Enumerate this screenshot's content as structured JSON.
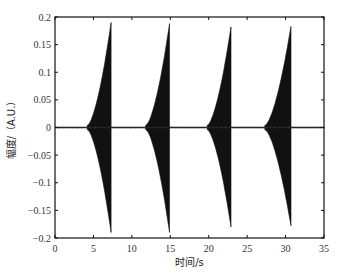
{
  "chart_data": {
    "type": "line",
    "title": "",
    "xlabel": "时间/s",
    "ylabel": "幅度/（A.U.）",
    "xlim": [
      0,
      35
    ],
    "ylim": [
      -0.2,
      0.2
    ],
    "xticks": [
      0,
      5,
      10,
      15,
      20,
      25,
      30,
      35
    ],
    "xtick_labels": [
      "0",
      "5",
      "10",
      "15",
      "20",
      "25",
      "30",
      "35"
    ],
    "yticks": [
      0.2,
      0.15,
      0.1,
      0.05,
      0,
      -0.05,
      -0.1,
      -0.15,
      -0.2
    ],
    "ytick_labels": [
      "0.2",
      "0.15",
      "0.1",
      "0.05",
      "0",
      "−0.05",
      "−0.1",
      "−0.15",
      "−0.2"
    ],
    "grid": false,
    "legend": null,
    "series": [
      {
        "name": "signal",
        "color": "#111111",
        "bursts": [
          {
            "start": 4.2,
            "peak_time": 7.3,
            "peak_pos": 0.19,
            "peak_neg": -0.19
          },
          {
            "start": 11.8,
            "peak_time": 14.9,
            "peak_pos": 0.188,
            "peak_neg": -0.19
          },
          {
            "start": 19.8,
            "peak_time": 22.9,
            "peak_pos": 0.182,
            "peak_neg": -0.18
          },
          {
            "start": 27.3,
            "peak_time": 30.7,
            "peak_pos": 0.183,
            "peak_neg": -0.178
          }
        ],
        "baseline_noise": 0.002
      }
    ]
  },
  "layout": {
    "plot": {
      "left": 55,
      "top": 17,
      "right": 324,
      "bottom": 238
    },
    "axis_color": "#111111",
    "fill_color": "#111111"
  }
}
